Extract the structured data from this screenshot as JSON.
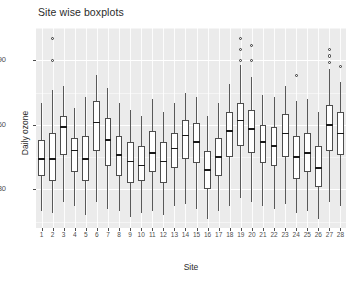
{
  "chart_data": {
    "type": "boxplot",
    "title": "Site wise boxplots",
    "xlabel": "Site",
    "ylabel": "Daily ozone",
    "ylim": [
      12,
      105
    ],
    "yticks": [
      30,
      60,
      90
    ],
    "ytick_labels": [
      "30",
      "60",
      "90"
    ],
    "grid": true,
    "legend": "none",
    "panel_background": "#ebebeb",
    "grid_color": "#ffffff",
    "box_fill": "#ffffff",
    "box_border": "#4d4d4d",
    "median_color": "#1a1a1a",
    "categories": [
      "1",
      "2",
      "3",
      "4",
      "5",
      "6",
      "7",
      "8",
      "9",
      "10",
      "11",
      "12",
      "13",
      "14",
      "15",
      "16",
      "17",
      "18",
      "19",
      "20",
      "21",
      "22",
      "23",
      "24",
      "25",
      "26",
      "27",
      "28"
    ],
    "boxes": [
      {
        "site": "1",
        "lower_whisker": 20,
        "q1": 36,
        "median": 44,
        "q3": 53,
        "upper_whisker": 70,
        "outliers": []
      },
      {
        "site": "2",
        "lower_whisker": 19,
        "q1": 34,
        "median": 44,
        "q3": 56,
        "upper_whisker": 76,
        "outliers": [
          100,
          90
        ]
      },
      {
        "site": "3",
        "lower_whisker": 24,
        "q1": 46,
        "median": 59,
        "q3": 64,
        "upper_whisker": 78,
        "outliers": []
      },
      {
        "site": "4",
        "lower_whisker": 22,
        "q1": 38,
        "median": 48,
        "q3": 54,
        "upper_whisker": 68,
        "outliers": []
      },
      {
        "site": "5",
        "lower_whisker": 18,
        "q1": 34,
        "median": 44,
        "q3": 55,
        "upper_whisker": 73,
        "outliers": []
      },
      {
        "site": "6",
        "lower_whisker": 24,
        "q1": 48,
        "median": 61,
        "q3": 71,
        "upper_whisker": 83,
        "outliers": []
      },
      {
        "site": "7",
        "lower_whisker": 21,
        "q1": 41,
        "median": 53,
        "q3": 63,
        "upper_whisker": 77,
        "outliers": []
      },
      {
        "site": "8",
        "lower_whisker": 20,
        "q1": 36,
        "median": 46,
        "q3": 55,
        "upper_whisker": 70,
        "outliers": []
      },
      {
        "site": "9",
        "lower_whisker": 17,
        "q1": 33,
        "median": 43,
        "q3": 52,
        "upper_whisker": 67,
        "outliers": []
      },
      {
        "site": "10",
        "lower_whisker": 19,
        "q1": 34,
        "median": 41,
        "q3": 50,
        "upper_whisker": 64,
        "outliers": []
      },
      {
        "site": "11",
        "lower_whisker": 20,
        "q1": 38,
        "median": 47,
        "q3": 57,
        "upper_whisker": 72,
        "outliers": []
      },
      {
        "site": "12",
        "lower_whisker": 18,
        "q1": 33,
        "median": 43,
        "q3": 52,
        "upper_whisker": 66,
        "outliers": []
      },
      {
        "site": "13",
        "lower_whisker": 22,
        "q1": 40,
        "median": 49,
        "q3": 56,
        "upper_whisker": 70,
        "outliers": []
      },
      {
        "site": "14",
        "lower_whisker": 23,
        "q1": 44,
        "median": 55,
        "q3": 62,
        "upper_whisker": 75,
        "outliers": []
      },
      {
        "site": "15",
        "lower_whisker": 21,
        "q1": 42,
        "median": 52,
        "q3": 61,
        "upper_whisker": 73,
        "outliers": []
      },
      {
        "site": "16",
        "lower_whisker": 16,
        "q1": 30,
        "median": 39,
        "q3": 48,
        "upper_whisker": 64,
        "outliers": []
      },
      {
        "site": "17",
        "lower_whisker": 20,
        "q1": 36,
        "median": 45,
        "q3": 54,
        "upper_whisker": 70,
        "outliers": []
      },
      {
        "site": "18",
        "lower_whisker": 22,
        "q1": 45,
        "median": 57,
        "q3": 66,
        "upper_whisker": 79,
        "outliers": []
      },
      {
        "site": "19",
        "lower_whisker": 26,
        "q1": 50,
        "median": 62,
        "q3": 70,
        "upper_whisker": 88,
        "outliers": [
          100,
          95,
          90
        ]
      },
      {
        "site": "20",
        "lower_whisker": 24,
        "q1": 47,
        "median": 58,
        "q3": 67,
        "upper_whisker": 82,
        "outliers": [
          97,
          90
        ]
      },
      {
        "site": "21",
        "lower_whisker": 22,
        "q1": 42,
        "median": 52,
        "q3": 60,
        "upper_whisker": 74,
        "outliers": []
      },
      {
        "site": "22",
        "lower_whisker": 21,
        "q1": 41,
        "median": 50,
        "q3": 59,
        "upper_whisker": 73,
        "outliers": []
      },
      {
        "site": "23",
        "lower_whisker": 23,
        "q1": 45,
        "median": 56,
        "q3": 65,
        "upper_whisker": 78,
        "outliers": []
      },
      {
        "site": "24",
        "lower_whisker": 19,
        "q1": 35,
        "median": 45,
        "q3": 55,
        "upper_whisker": 71,
        "outliers": [
          83
        ]
      },
      {
        "site": "25",
        "lower_whisker": 20,
        "q1": 38,
        "median": 47,
        "q3": 56,
        "upper_whisker": 72,
        "outliers": []
      },
      {
        "site": "26",
        "lower_whisker": 16,
        "q1": 31,
        "median": 40,
        "q3": 50,
        "upper_whisker": 66,
        "outliers": []
      },
      {
        "site": "27",
        "lower_whisker": 24,
        "q1": 48,
        "median": 60,
        "q3": 69,
        "upper_whisker": 86,
        "outliers": [
          95,
          92,
          89
        ]
      },
      {
        "site": "28",
        "lower_whisker": 22,
        "q1": 46,
        "median": 56,
        "q3": 66,
        "upper_whisker": 80,
        "outliers": [
          87
        ]
      }
    ]
  }
}
